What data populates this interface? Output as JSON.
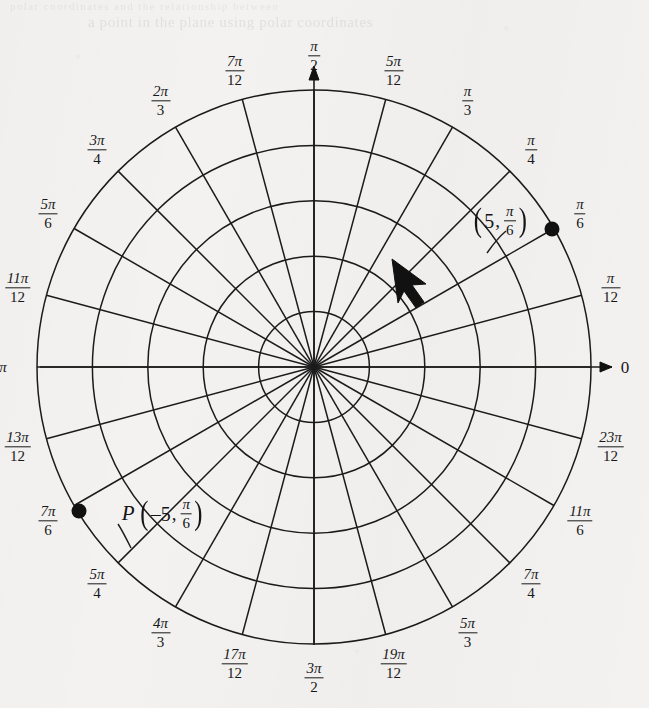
{
  "figure": {
    "background_color": "#f3f2f0",
    "ink_color": "#1b1b1b",
    "ghost_text_top": "a point in the plane using polar coordinates",
    "ghost_text_edge": "polar coordinates and the relationship between"
  },
  "chart_data": {
    "type": "scatter",
    "coordinate_system": "polar",
    "xlabel": "",
    "ylabel": "",
    "grid": true,
    "legend_position": "none",
    "radial_axis": {
      "max_radius_units": 5,
      "circle_count": 5,
      "circle_radii_units": [
        1,
        2,
        3,
        4,
        5
      ],
      "tick_labels_shown": false
    },
    "angular_axis": {
      "units": "radians",
      "spoke_count": 24,
      "spoke_step": "pi/12",
      "direction": "counterclockwise"
    },
    "points": [
      {
        "name": "point-5-pi-over-6",
        "label": "(5, π/6)",
        "r": 5,
        "theta": "pi/6",
        "theta_degrees": 30,
        "marker": "filled-dot"
      },
      {
        "name": "point-P-negative-5-pi-over-6",
        "label": "P(-5, π/6)",
        "r": -5,
        "theta": "pi/6",
        "theta_degrees": 210,
        "marker": "filled-dot"
      }
    ],
    "annotations": [
      {
        "name": "direction-arrow",
        "description": "arrow indicating counterclockwise direction of increasing theta"
      }
    ],
    "angle_tick_labels": [
      {
        "angle_deg": 0,
        "num": "",
        "den": "",
        "plain": "0"
      },
      {
        "angle_deg": 15,
        "num": "π",
        "den": "12",
        "plain": ""
      },
      {
        "angle_deg": 30,
        "num": "π",
        "den": "6",
        "plain": ""
      },
      {
        "angle_deg": 45,
        "num": "π",
        "den": "4",
        "plain": ""
      },
      {
        "angle_deg": 60,
        "num": "π",
        "den": "3",
        "plain": ""
      },
      {
        "angle_deg": 75,
        "num": "5π",
        "den": "12",
        "plain": ""
      },
      {
        "angle_deg": 90,
        "num": "π",
        "den": "2",
        "plain": ""
      },
      {
        "angle_deg": 105,
        "num": "7π",
        "den": "12",
        "plain": ""
      },
      {
        "angle_deg": 120,
        "num": "2π",
        "den": "3",
        "plain": ""
      },
      {
        "angle_deg": 135,
        "num": "3π",
        "den": "4",
        "plain": ""
      },
      {
        "angle_deg": 150,
        "num": "5π",
        "den": "6",
        "plain": ""
      },
      {
        "angle_deg": 165,
        "num": "11π",
        "den": "12",
        "plain": ""
      },
      {
        "angle_deg": 180,
        "num": "",
        "den": "",
        "plain": "π"
      },
      {
        "angle_deg": 195,
        "num": "13π",
        "den": "12",
        "plain": ""
      },
      {
        "angle_deg": 210,
        "num": "7π",
        "den": "6",
        "plain": ""
      },
      {
        "angle_deg": 225,
        "num": "5π",
        "den": "4",
        "plain": ""
      },
      {
        "angle_deg": 240,
        "num": "4π",
        "den": "3",
        "plain": ""
      },
      {
        "angle_deg": 255,
        "num": "17π",
        "den": "12",
        "plain": ""
      },
      {
        "angle_deg": 270,
        "num": "3π",
        "den": "2",
        "plain": ""
      },
      {
        "angle_deg": 285,
        "num": "19π",
        "den": "12",
        "plain": ""
      },
      {
        "angle_deg": 300,
        "num": "5π",
        "den": "3",
        "plain": ""
      },
      {
        "angle_deg": 315,
        "num": "7π",
        "den": "4",
        "plain": ""
      },
      {
        "angle_deg": 330,
        "num": "11π",
        "den": "6",
        "plain": ""
      },
      {
        "angle_deg": 345,
        "num": "23π",
        "den": "12",
        "plain": ""
      }
    ]
  },
  "point_annotations": {
    "upper": {
      "name": "label-5-pi-over-6",
      "prefix": "",
      "open_paren": "(",
      "r": "5",
      "comma": ",",
      "theta_num": "π",
      "theta_den": "6",
      "close_paren": ")"
    },
    "lower": {
      "name": "label-P-negative-5-pi-over-6",
      "prefix": "P",
      "open_paren": "(",
      "r": "–5",
      "comma": ",",
      "theta_num": "π",
      "theta_den": "6",
      "close_paren": ")"
    }
  }
}
